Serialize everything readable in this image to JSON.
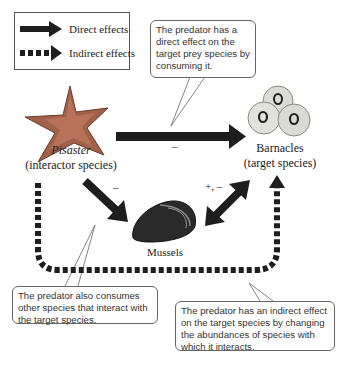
{
  "legend": {
    "direct_label": "Direct effects",
    "indirect_label": "Indirect effects"
  },
  "nodes": {
    "pisaster": {
      "name": "Pisaster",
      "role": "(interactor species)"
    },
    "barnacles": {
      "name": "Barnacles",
      "role": "(target species)"
    },
    "mussels": {
      "name": "Mussels"
    }
  },
  "signs": {
    "pisaster_to_barnacles": "–",
    "pisaster_to_mussels": "–",
    "mussels_barnacles": "+, –"
  },
  "callouts": {
    "direct": "The predator has a direct effect on the target prey species by consuming it.",
    "other_species": "The predator also consumes other species that interact with the target species.",
    "indirect": "The predator has an indirect effect on the target species by changing the abundances of species with which it interacts."
  },
  "colors": {
    "arrow": "#1e1e1e",
    "callout_border": "#666666",
    "starfish": "#a0604a",
    "barnacle": "#dcdcd6",
    "mussel": "#2a2a2a"
  }
}
